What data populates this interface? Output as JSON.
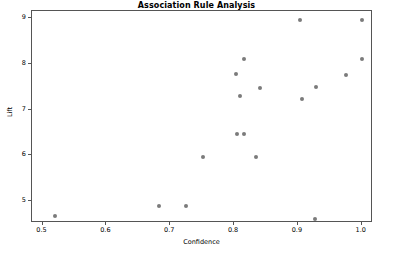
{
  "chart_data": {
    "type": "scatter",
    "title": "Association Rule Analysis",
    "xlabel": "Confidence",
    "ylabel": "Lift",
    "xlim": [
      0.4835,
      1.0176
    ],
    "ylim": [
      4.52,
      9.16
    ],
    "xticks": [
      0.5,
      0.6,
      0.7,
      0.8,
      0.9,
      1.0
    ],
    "xtick_labels": [
      "0.5",
      "0.6",
      "0.7",
      "0.8",
      "0.9",
      "1.0"
    ],
    "yticks": [
      5,
      6,
      7,
      8,
      9
    ],
    "ytick_labels": [
      "5",
      "6",
      "7",
      "8",
      "9"
    ],
    "grid": false,
    "legend": null,
    "marker_color": "#7b7b7b",
    "marker_size": 4,
    "points": [
      {
        "x": 0.519,
        "y": 4.68
      },
      {
        "x": 0.682,
        "y": 4.89
      },
      {
        "x": 0.724,
        "y": 4.89
      },
      {
        "x": 0.752,
        "y": 5.96
      },
      {
        "x": 0.805,
        "y": 6.47
      },
      {
        "x": 0.816,
        "y": 6.47
      },
      {
        "x": 0.835,
        "y": 5.96
      },
      {
        "x": 0.803,
        "y": 7.78
      },
      {
        "x": 0.809,
        "y": 7.29
      },
      {
        "x": 0.815,
        "y": 8.1
      },
      {
        "x": 0.84,
        "y": 7.48
      },
      {
        "x": 0.904,
        "y": 8.96
      },
      {
        "x": 0.906,
        "y": 7.23
      },
      {
        "x": 0.926,
        "y": 4.61
      },
      {
        "x": 0.928,
        "y": 7.5
      },
      {
        "x": 0.975,
        "y": 7.76
      },
      {
        "x": 1.0,
        "y": 8.1
      },
      {
        "x": 1.0,
        "y": 8.96
      }
    ]
  }
}
